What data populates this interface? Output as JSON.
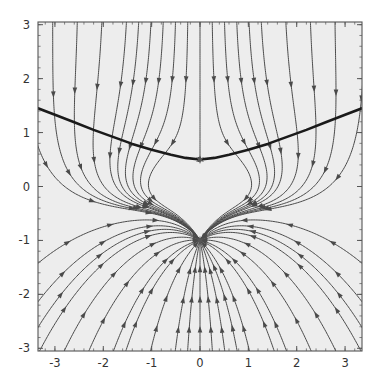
{
  "figure": {
    "type": "stream-plot",
    "background_color": "#ffffff",
    "plot_background_color": "#ededed",
    "frame_color": "#555555",
    "streamline_color": "#4a4a4a",
    "separatrix_color": "#1a1a1a",
    "marker_color": "#555555",
    "tick_label_color": "#333333"
  },
  "chart_data": {
    "type": "scatter",
    "title": "",
    "xlabel": "",
    "ylabel": "",
    "xlim": [
      -3.35,
      3.35
    ],
    "ylim": [
      -3.05,
      3.05
    ],
    "grid": false,
    "legend": null,
    "x_ticks": [
      -3,
      -2,
      -1,
      0,
      1,
      2,
      3
    ],
    "x_tick_labels": [
      "-3",
      "-2",
      "-1",
      "0",
      "1",
      "2",
      "3"
    ],
    "y_ticks": [
      -3,
      -2,
      -1,
      0,
      1,
      2,
      3
    ],
    "y_tick_labels": [
      "-3",
      "-2",
      "-1",
      "0",
      "1",
      "2",
      "3"
    ],
    "x_minor_tick_step": 0.2,
    "y_minor_tick_step": 0.2,
    "fixed_points": [
      {
        "name": "saddle-point",
        "x": 0,
        "y": 0.5,
        "marker": "star"
      },
      {
        "name": "sink-point",
        "x": 0,
        "y": -1,
        "marker": "star"
      }
    ],
    "separatrix": {
      "name": "stable-manifold",
      "description": "bold curve through saddle point",
      "points": [
        [
          -3.35,
          1.45
        ],
        [
          -3.0,
          1.33
        ],
        [
          -2.6,
          1.19
        ],
        [
          -2.2,
          1.05
        ],
        [
          -1.8,
          0.92
        ],
        [
          -1.4,
          0.79
        ],
        [
          -1.0,
          0.68
        ],
        [
          -0.6,
          0.59
        ],
        [
          -0.3,
          0.53
        ],
        [
          0.0,
          0.5
        ],
        [
          0.3,
          0.53
        ],
        [
          0.6,
          0.59
        ],
        [
          1.0,
          0.68
        ],
        [
          1.4,
          0.79
        ],
        [
          1.8,
          0.92
        ],
        [
          2.2,
          1.05
        ],
        [
          2.6,
          1.19
        ],
        [
          3.0,
          1.33
        ],
        [
          3.35,
          1.45
        ]
      ]
    },
    "flow_description": "Streamlines converge toward the node at (0,-1); near the saddle at (0,0.5) trajectories are deflected outward along the horizontal direction.",
    "arrow_direction": "toward-attractor"
  },
  "axes": {
    "x_axis_name": "x-axis",
    "y_axis_name": "y-axis"
  }
}
